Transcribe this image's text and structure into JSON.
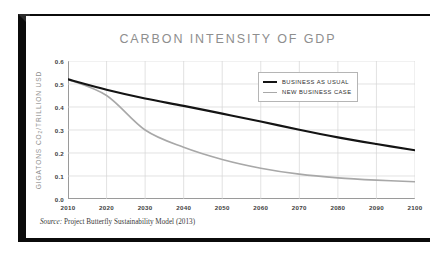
{
  "figure": {
    "title": "CARBON INTENSITY OF GDP",
    "source_label": "Source:",
    "source_text": "Project Butterfly Sustainability Model (2013)",
    "frame_color": "#0b0b0b",
    "background": "#ffffff"
  },
  "chart_data": {
    "type": "line",
    "title": "CARBON INTENSITY OF GDP",
    "xlabel": "",
    "ylabel": "GIGATONS CO2/TRILLION USD",
    "ylabel_parts": {
      "pre": "GIGATONS CO",
      "sub": "2",
      "post": "/TRILLION USD"
    },
    "x": [
      2010,
      2020,
      2030,
      2040,
      2050,
      2060,
      2070,
      2080,
      2090,
      2100
    ],
    "xlim": [
      2010,
      2100
    ],
    "ylim": [
      0.0,
      0.6
    ],
    "xticks": [
      "2010",
      "2020",
      "2030",
      "2040",
      "2050",
      "2060",
      "2070",
      "2080",
      "2090",
      "2100"
    ],
    "yticks": [
      "0.0",
      "0.1",
      "0.2",
      "0.3",
      "0.4",
      "0.5",
      "0.6"
    ],
    "ytick_values": [
      0.0,
      0.1,
      0.2,
      0.3,
      0.4,
      0.5,
      0.6
    ],
    "grid": true,
    "grid_color": "#d6d6d6",
    "legend_position": "upper right",
    "series": [
      {
        "name": "BUSINESS AS USUAL",
        "color": "#141414",
        "width": 2.2,
        "values": [
          0.52,
          0.475,
          0.437,
          0.405,
          0.371,
          0.337,
          0.301,
          0.268,
          0.239,
          0.212
        ]
      },
      {
        "name": "NEW BUSINESS CASE",
        "color": "#a8a8a8",
        "width": 1.6,
        "values": [
          0.52,
          0.45,
          0.3,
          0.225,
          0.172,
          0.134,
          0.108,
          0.092,
          0.082,
          0.075
        ]
      }
    ]
  }
}
